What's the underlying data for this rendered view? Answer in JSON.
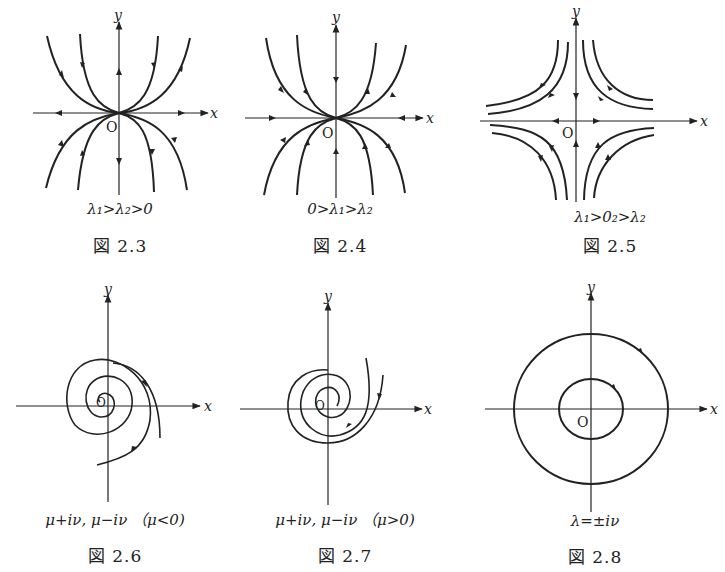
{
  "figures": [
    {
      "id": "2.3",
      "label": "図 2.3",
      "condition": "λ₁>λ₂>0",
      "type": "unstable node",
      "axes": {
        "x": "x",
        "y": "y",
        "origin": "O"
      }
    },
    {
      "id": "2.4",
      "label": "図 2.4",
      "condition": "0>λ₁>λ₂",
      "type": "stable node",
      "axes": {
        "x": "x",
        "y": "y",
        "origin": "O"
      }
    },
    {
      "id": "2.5",
      "label": "図 2.5",
      "condition": "λ₁>0₂>λ₂",
      "type": "saddle point",
      "axes": {
        "x": "x",
        "y": "y",
        "origin": "O"
      }
    },
    {
      "id": "2.6",
      "label": "図 2.6",
      "condition": "μ+iν, μ−iν （μ<0)",
      "type": "stable spiral",
      "axes": {
        "x": "x",
        "y": "y",
        "origin": "O"
      }
    },
    {
      "id": "2.7",
      "label": "図 2.7",
      "condition": "μ+iν, μ−iν （μ>0)",
      "type": "unstable spiral",
      "axes": {
        "x": "x",
        "y": "y",
        "origin": "O"
      }
    },
    {
      "id": "2.8",
      "label": "図 2.8",
      "condition": "λ=±iν",
      "type": "center",
      "axes": {
        "x": "x",
        "y": "y",
        "origin": "O"
      }
    }
  ],
  "colors": {
    "ink": "#222222",
    "background": "#ffffff"
  }
}
